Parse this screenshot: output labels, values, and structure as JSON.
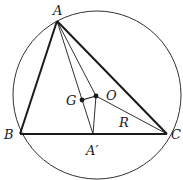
{
  "diagram": {
    "title": "",
    "circle": {
      "cx": 97,
      "cy": 95,
      "r": 84,
      "label": "circumcircle"
    },
    "points": {
      "A": {
        "x": 57,
        "y": 21,
        "label": "A"
      },
      "B": {
        "x": 20,
        "y": 134,
        "label": "B"
      },
      "C": {
        "x": 167,
        "y": 134,
        "label": "C"
      },
      "A_prime": {
        "x": 93,
        "y": 134,
        "label": "A′"
      },
      "G": {
        "x": 82,
        "y": 100,
        "label": "G"
      },
      "O": {
        "x": 96,
        "y": 96,
        "label": "O"
      }
    },
    "segment_labels": {
      "R": "R"
    },
    "colors": {
      "stroke": "#1a1a1a",
      "background": "#ffffff"
    }
  }
}
